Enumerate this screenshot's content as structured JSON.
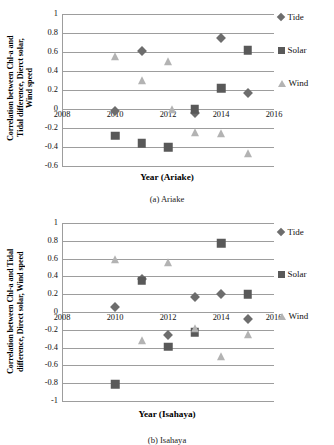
{
  "figure": {
    "panel_a_caption": "(a) Ariake",
    "panel_b_caption": "(b) Isahaya"
  },
  "legend": {
    "entries": [
      {
        "label": "Tide",
        "marker": "diamond-marker",
        "color": "#6d6d6d"
      },
      {
        "label": "Solar",
        "marker": "square-marker",
        "color": "#595959"
      },
      {
        "label": "Wind",
        "marker": "triangle-marker",
        "color": "#b3b3b3"
      }
    ]
  },
  "chart_data": [
    {
      "type": "scatter",
      "id": "ariake",
      "title": "",
      "xlabel": "Year (Ariake)",
      "ylabel": "Correlation between Chl-a and\nTidal difference, Dierct solar,\nWind speed",
      "xlim": [
        2008,
        2016
      ],
      "ylim": [
        -0.6,
        1
      ],
      "xticks": [
        "2008",
        "2010",
        "2012",
        "2014",
        "2016"
      ],
      "xtick_values": [
        2008,
        2010,
        2012,
        2014,
        2016
      ],
      "yticks": [
        "1",
        "0.8",
        "0.6",
        "0.4",
        "0.2",
        "0",
        "-0.2",
        "-0.4",
        "-0.6"
      ],
      "ytick_values": [
        1,
        0.8,
        0.6,
        0.4,
        0.2,
        0,
        -0.2,
        -0.4,
        -0.6
      ],
      "grid": true,
      "legend_position": "right",
      "series": [
        {
          "name": "Tide",
          "marker": "diamond",
          "color": "#6d6d6d",
          "points": [
            {
              "x": 2010,
              "y": -0.02
            },
            {
              "x": 2011,
              "y": 0.61
            },
            {
              "x": 2013,
              "y": -0.04
            },
            {
              "x": 2014,
              "y": 0.75
            },
            {
              "x": 2015,
              "y": 0.17
            }
          ]
        },
        {
          "name": "Solar",
          "marker": "square",
          "color": "#595959",
          "points": [
            {
              "x": 2010,
              "y": -0.28
            },
            {
              "x": 2011,
              "y": -0.36
            },
            {
              "x": 2012,
              "y": -0.4
            },
            {
              "x": 2013,
              "y": 0.0
            },
            {
              "x": 2014,
              "y": 0.22
            },
            {
              "x": 2015,
              "y": 0.62
            }
          ]
        },
        {
          "name": "Wind",
          "marker": "triangle",
          "color": "#b3b3b3",
          "points": [
            {
              "x": 2010,
              "y": 0.55
            },
            {
              "x": 2011,
              "y": 0.29
            },
            {
              "x": 2012,
              "y": 0.49
            },
            {
              "x": 2012.15,
              "y": -0.01
            },
            {
              "x": 2013,
              "y": -0.25
            },
            {
              "x": 2014,
              "y": -0.26
            },
            {
              "x": 2015,
              "y": -0.47
            }
          ]
        }
      ]
    },
    {
      "type": "scatter",
      "id": "isahaya",
      "title": "",
      "xlabel": "Year (Isahaya)",
      "ylabel": "Correlation between Chl-a and Tidal\ndifference, Direct solar, Wind speed",
      "xlim": [
        2008,
        2016
      ],
      "ylim": [
        -1,
        1
      ],
      "xticks": [
        "2008",
        "2010",
        "2012",
        "2014",
        "2016"
      ],
      "xtick_values": [
        2008,
        2010,
        2012,
        2014,
        2016
      ],
      "yticks": [
        "1",
        "0.8",
        "0.6",
        "0.4",
        "0.2",
        "0",
        "-0.2",
        "-0.4",
        "-0.6",
        "-0.8",
        "-1"
      ],
      "ytick_values": [
        1,
        0.8,
        0.6,
        0.4,
        0.2,
        0,
        -0.2,
        -0.4,
        -0.6,
        -0.8,
        -1
      ],
      "grid": true,
      "legend_position": "right",
      "series": [
        {
          "name": "Tide",
          "marker": "diamond",
          "color": "#6d6d6d",
          "points": [
            {
              "x": 2010,
              "y": 0.06
            },
            {
              "x": 2011,
              "y": 0.37
            },
            {
              "x": 2012,
              "y": -0.26
            },
            {
              "x": 2013,
              "y": 0.17
            },
            {
              "x": 2014,
              "y": 0.2
            },
            {
              "x": 2015,
              "y": -0.08
            }
          ]
        },
        {
          "name": "Solar",
          "marker": "square",
          "color": "#595959",
          "points": [
            {
              "x": 2010,
              "y": -0.81
            },
            {
              "x": 2011,
              "y": 0.35
            },
            {
              "x": 2012,
              "y": -0.39
            },
            {
              "x": 2013,
              "y": -0.23
            },
            {
              "x": 2014,
              "y": 0.77
            },
            {
              "x": 2015,
              "y": 0.2
            }
          ]
        },
        {
          "name": "Wind",
          "marker": "triangle",
          "color": "#b3b3b3",
          "points": [
            {
              "x": 2010,
              "y": 0.58
            },
            {
              "x": 2011,
              "y": -0.33
            },
            {
              "x": 2012,
              "y": 0.55
            },
            {
              "x": 2013,
              "y": -0.19
            },
            {
              "x": 2014,
              "y": -0.5
            },
            {
              "x": 2015,
              "y": -0.26
            }
          ]
        }
      ]
    }
  ]
}
